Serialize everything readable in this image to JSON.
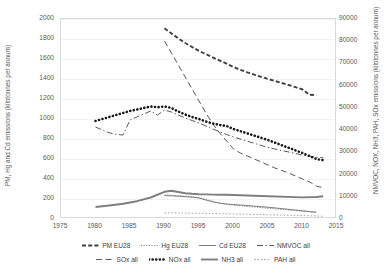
{
  "chart_data": {
    "type": "line",
    "title": "",
    "xlabel": "",
    "ylabel": "PM, Hg and Cd emissions (kilotonnes per annum)",
    "y2label": "NMVOC, NOX, NH3, PAH, SOx emissions (kilotonnes per annum)",
    "xlim": [
      1975,
      2015
    ],
    "ylim": [
      0,
      2000
    ],
    "y2lim": [
      0,
      90000
    ],
    "xticks": [
      1975,
      1980,
      1985,
      1990,
      1995,
      2000,
      2005,
      2010,
      2015
    ],
    "yticks": [
      0,
      200,
      400,
      600,
      800,
      1000,
      1200,
      1400,
      1600,
      1800,
      2000
    ],
    "y2ticks": [
      0,
      10000,
      20000,
      30000,
      40000,
      50000,
      60000,
      70000,
      80000,
      90000
    ],
    "grid": true,
    "legend_position": "bottom",
    "series": [
      {
        "name": "PM EU28",
        "axis": "right",
        "style": "dashed",
        "width": 1.9,
        "color": "#404040",
        "x": [
          1990,
          1991,
          1992,
          1993,
          1994,
          1995,
          1996,
          1997,
          1998,
          1999,
          2000,
          2001,
          2002,
          2003,
          2004,
          2005,
          2006,
          2007,
          2008,
          2009,
          2010,
          2011,
          2012
        ],
        "values": [
          85800,
          83500,
          81300,
          79200,
          77400,
          75600,
          74200,
          72700,
          71300,
          69900,
          68400,
          67100,
          66000,
          65000,
          64000,
          63000,
          62100,
          61200,
          60300,
          59300,
          58300,
          55900,
          55700
        ]
      },
      {
        "name": "Hg EU28",
        "axis": "left",
        "style": "dotted-fine",
        "width": 1.0,
        "color": "#808080",
        "x": [
          1990,
          1991,
          1992,
          1993,
          1994,
          1995,
          1996,
          1997,
          1998,
          1999,
          2000,
          2005,
          2010,
          2012
        ],
        "values": [
          240,
          238,
          233,
          228,
          222,
          214,
          196,
          176,
          158,
          146,
          138,
          108,
          78,
          66
        ]
      },
      {
        "name": "Cd EU28",
        "axis": "left",
        "style": "solid-thin",
        "width": 1.0,
        "color": "#7f7f7f",
        "x": [
          1990,
          1991,
          1992,
          1993,
          1994,
          1995,
          1996,
          1997,
          1998,
          1999,
          2000,
          2005,
          2010,
          2012
        ],
        "values": [
          234,
          232,
          228,
          223,
          218,
          210,
          190,
          172,
          158,
          150,
          145,
          118,
          82,
          68
        ]
      },
      {
        "name": "NMVOC all",
        "axis": "left",
        "style": "dash-dot",
        "width": 1.0,
        "color": "#595959",
        "x": [
          1980,
          1981,
          1982,
          1983,
          1984,
          1985,
          1986,
          1987,
          1988,
          1989,
          1990,
          1991,
          1992,
          1993,
          1994,
          1995,
          1996,
          1997,
          1998,
          1999,
          2000,
          2005,
          2010,
          2012,
          2013
        ],
        "values": [
          920,
          890,
          862,
          846,
          840,
          990,
          1020,
          1050,
          1080,
          1040,
          1090,
          1070,
          1040,
          1010,
          985,
          960,
          930,
          900,
          872,
          845,
          820,
          715,
          640,
          618,
          612
        ]
      },
      {
        "name": "SOx all",
        "axis": "left",
        "style": "long-dash",
        "width": 1.0,
        "color": "#595959",
        "x": [
          1990,
          1991,
          1992,
          1993,
          1994,
          1995,
          1996,
          1997,
          1998,
          1999,
          2000,
          2001,
          2002,
          2003,
          2004,
          2005,
          2006,
          2007,
          2008,
          2009,
          2010,
          2011,
          2012,
          2013
        ],
        "values": [
          1780,
          1660,
          1540,
          1420,
          1300,
          1180,
          1060,
          950,
          860,
          780,
          700,
          660,
          630,
          600,
          570,
          540,
          510,
          485,
          460,
          430,
          400,
          372,
          330,
          312
        ]
      },
      {
        "name": "NOx all",
        "axis": "left",
        "style": "thick-dot",
        "width": 2.6,
        "color": "#1a1a1a",
        "x": [
          1980,
          1981,
          1982,
          1983,
          1984,
          1985,
          1986,
          1987,
          1988,
          1989,
          1990,
          1991,
          1992,
          1993,
          1994,
          1995,
          1996,
          1997,
          1998,
          1999,
          2000,
          2005,
          2010,
          2012,
          2013
        ],
        "values": [
          980,
          1000,
          1020,
          1040,
          1060,
          1080,
          1095,
          1110,
          1125,
          1118,
          1125,
          1110,
          1075,
          1045,
          1020,
          1000,
          975,
          955,
          940,
          930,
          900,
          790,
          660,
          600,
          588
        ]
      },
      {
        "name": "NH3 all",
        "axis": "left",
        "style": "solid",
        "width": 1.9,
        "color": "#7f7f7f",
        "x": [
          1980,
          1982,
          1984,
          1986,
          1988,
          1990,
          1991,
          1992,
          1993,
          1994,
          1995,
          1996,
          1997,
          1998,
          1999,
          2000,
          2005,
          2010,
          2012,
          2013
        ],
        "values": [
          120,
          135,
          152,
          178,
          215,
          272,
          282,
          270,
          258,
          252,
          248,
          246,
          244,
          243,
          242,
          240,
          228,
          216,
          220,
          228
        ]
      },
      {
        "name": "PAH all",
        "axis": "left",
        "style": "dotted",
        "width": 1.0,
        "color": "#a6a6a6",
        "x": [
          1990,
          1992,
          1994,
          1996,
          1998,
          2000,
          2002,
          2004,
          2006,
          2008,
          2010,
          2012,
          2013
        ],
        "values": [
          62,
          60,
          58,
          56,
          53,
          50,
          47,
          44,
          41,
          38,
          34,
          30,
          28
        ]
      }
    ]
  },
  "legend": {
    "rows": [
      [
        {
          "label": "PM EU28",
          "style": "dashed"
        },
        {
          "label": "Hg EU28",
          "style": "dotted-fine"
        },
        {
          "label": "Cd EU28",
          "style": "solid-thin"
        },
        {
          "label": "NMVOC all",
          "style": "dash-dot"
        }
      ],
      [
        {
          "label": "SOx all",
          "style": "long-dash"
        },
        {
          "label": "NOx all",
          "style": "thick-dot"
        },
        {
          "label": "NH3 all",
          "style": "solid"
        },
        {
          "label": "PAH all",
          "style": "dotted"
        }
      ]
    ]
  }
}
